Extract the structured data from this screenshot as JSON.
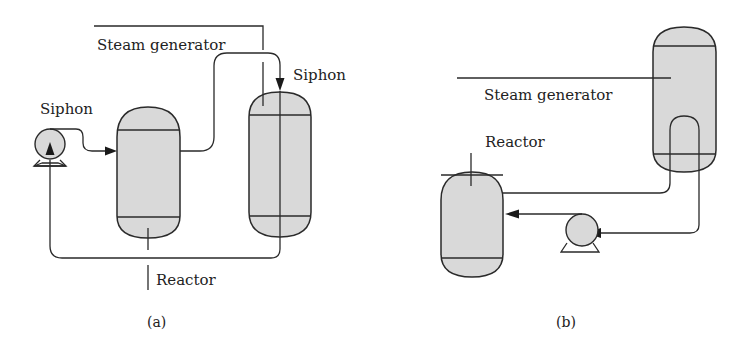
{
  "figure": {
    "panel_a": {
      "caption": "(a)",
      "labels": {
        "steam_generator": "Steam generator",
        "siphon_left": "Siphon",
        "siphon_right": "Siphon",
        "reactor": "Reactor"
      }
    },
    "panel_b": {
      "caption": "(b)",
      "labels": {
        "steam_generator": "Steam generator",
        "reactor": "Reactor"
      }
    },
    "colors": {
      "vessel_fill": "#d9d9d9",
      "stroke": "#2a2a2a",
      "background": "#ffffff"
    }
  }
}
